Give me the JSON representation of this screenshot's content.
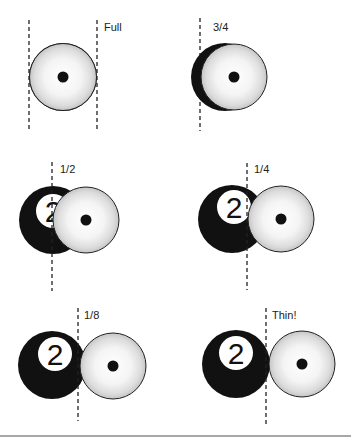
{
  "figure": {
    "diagrams": [
      {
        "label": "Full",
        "fraction": 1.0,
        "object_ball_number": null
      },
      {
        "label": "3/4",
        "fraction": 0.75,
        "object_ball_number": null
      },
      {
        "label": "1/2",
        "fraction": 0.5,
        "object_ball_number": "2"
      },
      {
        "label": "1/4",
        "fraction": 0.25,
        "object_ball_number": "2"
      },
      {
        "label": "1/8",
        "fraction": 0.125,
        "object_ball_number": "2"
      },
      {
        "label": "Thin!",
        "fraction": 0.0,
        "object_ball_number": "2"
      }
    ],
    "colors": {
      "object_ball": "#111111",
      "cue_ball_center": "#ffffff",
      "cue_ball_edge": "#c8c8c8",
      "outline": "#222222",
      "aim_line": "#222222",
      "rule": "#888888"
    }
  }
}
